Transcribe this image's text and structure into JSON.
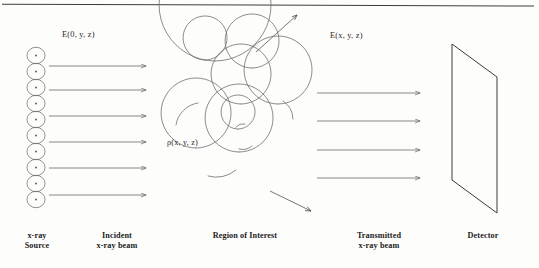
{
  "figure": {
    "type": "x-ray-imaging-schematic",
    "background_color": "#fdfdfc",
    "ink_color": "#555555",
    "text_color": "#1b1b1b",
    "top_rule": true
  },
  "labels": {
    "incident_field": "E(0, y, z)",
    "transmitted_field": "E(x, y, z)",
    "density": "ρ(x, y, z)"
  },
  "captions": {
    "source": "x-ray\nSource",
    "incident_beam": "Incident\nx-ray beam",
    "region": "Region of Interest",
    "transmitted_beam": "Transmitted\nx-ray beam",
    "detector": "Detector"
  },
  "source": {
    "icon": "x-ray-source-icon",
    "bead_count": 10,
    "bead_has_center_dot": true
  },
  "beams": {
    "incident_arrow_count": 6,
    "transmitted_arrow_count": 4,
    "scatter_arrow_count": 2
  },
  "detector": {
    "shape": "parallelogram"
  }
}
